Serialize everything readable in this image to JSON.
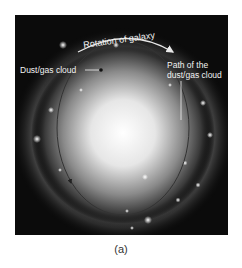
{
  "figure": {
    "labels": {
      "rotation": "Rotation of galaxy",
      "cloud": "Dust/gas cloud",
      "path_line1": "Path of the",
      "path_line2": "dust/gas cloud"
    },
    "caption": "(a)"
  }
}
